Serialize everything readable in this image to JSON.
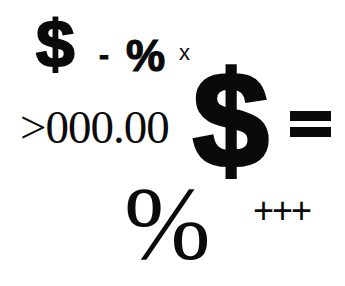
{
  "symbols": {
    "dollar_small": "$",
    "dash": "-",
    "percent_bold": "%",
    "times": "x",
    "number": ">000.00",
    "dollar_big": "$",
    "equals": "=",
    "percent_serif": "%",
    "plus": "+++"
  },
  "colors": {
    "background": "#ffffff",
    "ink": "#0a0a0a"
  }
}
